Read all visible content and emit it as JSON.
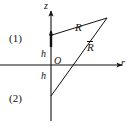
{
  "figure": {
    "axes": {
      "vertical_label": "z",
      "horizontal_label": "r",
      "origin_label": "O"
    },
    "labels": {
      "distance_direct": "R",
      "distance_image": "R",
      "distance_image_overbar": true,
      "height_upper": "h",
      "height_lower": "h",
      "region_upper": "(1)",
      "region_lower": "(2)"
    },
    "colors": {
      "line": "#111111",
      "background": "#ffffff",
      "text": "#111111"
    },
    "geometry": {
      "origin_px": [
        51,
        65
      ],
      "z_axis_top_px": [
        51,
        7
      ],
      "z_axis_bottom_px": [
        51,
        121
      ],
      "r_axis_left_px": [
        0,
        65
      ],
      "r_axis_right_px": [
        126,
        65
      ],
      "source_point_px": [
        51,
        35
      ],
      "image_point_px": [
        51,
        96
      ],
      "field_point_px": [
        108,
        17
      ],
      "source_marker_arrow_tip_px": [
        51,
        28
      ]
    }
  }
}
